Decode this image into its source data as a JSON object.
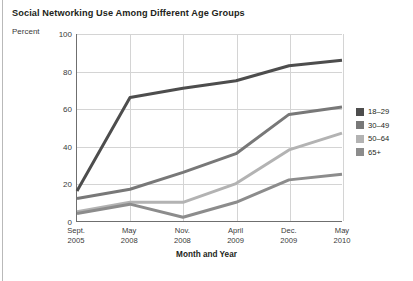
{
  "chart_data": {
    "type": "line",
    "title": "Social Networking Use Among Different Age Groups",
    "xlabel": "Month and Year",
    "ylabel": "Percent",
    "ylim": [
      0,
      100
    ],
    "yticks": [
      0,
      20,
      40,
      60,
      80,
      100
    ],
    "grid": true,
    "legend_position": "right",
    "categories": [
      {
        "month": "Sept.",
        "year": "2005"
      },
      {
        "month": "May",
        "year": "2008"
      },
      {
        "month": "Nov.",
        "year": "2008"
      },
      {
        "month": "April",
        "year": "2009"
      },
      {
        "month": "Dec.",
        "year": "2009"
      },
      {
        "month": "May",
        "year": "2010"
      }
    ],
    "series": [
      {
        "name": "18–29",
        "color": "#4d4d4d",
        "values": [
          16,
          66,
          71,
          75,
          83,
          86
        ]
      },
      {
        "name": "30–49",
        "color": "#787878",
        "values": [
          12,
          17,
          26,
          36,
          57,
          61
        ]
      },
      {
        "name": "50–64",
        "color": "#b3b3b3",
        "values": [
          5,
          10,
          10,
          20,
          38,
          47
        ]
      },
      {
        "name": "65+",
        "color": "#8c8c8c",
        "values": [
          4,
          9,
          2,
          10,
          22,
          25
        ]
      }
    ]
  },
  "legend": {
    "items": [
      {
        "label": "18–29",
        "color": "#4d4d4d"
      },
      {
        "label": "30–49",
        "color": "#787878"
      },
      {
        "label": "50–64",
        "color": "#b3b3b3"
      },
      {
        "label": "65+",
        "color": "#8c8c8c"
      }
    ]
  }
}
